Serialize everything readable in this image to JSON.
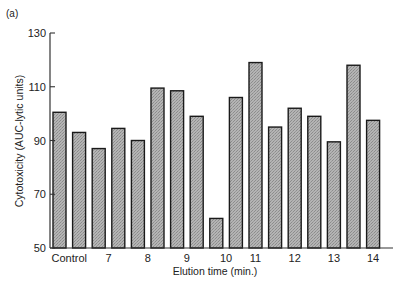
{
  "chart_data": {
    "type": "bar",
    "panel_label": "(a)",
    "title": "",
    "xlabel": "Elution time (min.)",
    "ylabel": "Cytotoxicity (AUC-lytic units)",
    "ylim": [
      50,
      130
    ],
    "yticks": [
      50,
      70,
      90,
      110,
      130
    ],
    "grid": false,
    "legend": null,
    "xtick_labels": [
      {
        "label": "Control",
        "bar_index": 0.5
      },
      {
        "label": "7",
        "bar_index": 2.5
      },
      {
        "label": "8",
        "bar_index": 4.5
      },
      {
        "label": "9",
        "bar_index": 6.5
      },
      {
        "label": "10",
        "bar_index": 8.5
      },
      {
        "label": "11",
        "bar_index": 10
      },
      {
        "label": "12",
        "bar_index": 12
      },
      {
        "label": "13",
        "bar_index": 14
      },
      {
        "label": "14",
        "bar_index": 16
      }
    ],
    "values": [
      100.5,
      93,
      87,
      94.5,
      90,
      109.5,
      108.5,
      99,
      61,
      106,
      119,
      95,
      102,
      99,
      89.5,
      118,
      97.5
    ],
    "bar_fill": "#a8a8a8",
    "bar_edge": "#1a1a1a"
  }
}
